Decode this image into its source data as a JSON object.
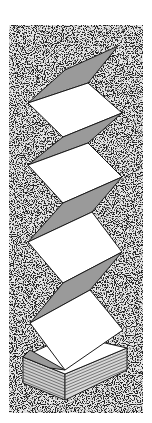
{
  "illustration": {
    "subject": "accordion-folded paper sheets unfolding from a stack",
    "background": "speckled noise texture",
    "panels_unfolded": 4,
    "colors": {
      "page_background": "#ffffff",
      "paper": "#ffffff",
      "fold_shade": "#9a9a9a",
      "outline": "#1a1a1a",
      "noise_dark": "#222222",
      "noise_light": "#e8e8e8"
    }
  }
}
